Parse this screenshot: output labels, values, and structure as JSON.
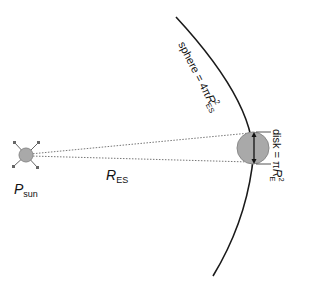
{
  "diagram": {
    "sun": {
      "label_main": "P",
      "label_sub": "sun",
      "fill": "#a9a9a9",
      "stroke": "#8a8a8a"
    },
    "distance": {
      "label_main": "R",
      "label_sub": "ES"
    },
    "sphere": {
      "label_prefix": "sphere = 4",
      "label_pi": "π",
      "label_R": "R",
      "label_sup": "2",
      "label_sub": "ES",
      "stroke": "#1a1a1a"
    },
    "disk": {
      "label_prefix": "disk = ",
      "label_pi": "π",
      "label_R": "R",
      "label_sup": "2",
      "label_sub": "E",
      "fill": "#a9a9a9",
      "stroke": "#8a8a8a"
    },
    "line_color": "#555555",
    "dotted_color": "#777777"
  }
}
